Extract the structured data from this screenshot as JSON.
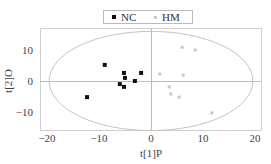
{
  "chart_data": {
    "type": "scatter",
    "title": "",
    "xlabel": "t[1]P",
    "ylabel": "t[2]O",
    "xlim": [
      -22,
      22.5
    ],
    "ylim": [
      -16,
      17
    ],
    "xticks": [
      -20,
      -10,
      0,
      10,
      20
    ],
    "yticks": [
      -10,
      0,
      10
    ],
    "grid": false,
    "legend_position": "top-center",
    "ellipse": {
      "cx": 0,
      "cy": 0,
      "rx": 19.6,
      "ry": 16
    },
    "series": [
      {
        "name": "NC",
        "color": "#111111",
        "marker": "square",
        "points": [
          [
            -8.9,
            5.2
          ],
          [
            -5.2,
            2.6
          ],
          [
            -1.9,
            2.6
          ],
          [
            -5.0,
            1.0
          ],
          [
            -3.1,
            0.0
          ],
          [
            -6.0,
            -1.0
          ],
          [
            -5.2,
            -1.9
          ],
          [
            -12.3,
            -5.2
          ]
        ]
      },
      {
        "name": "HM",
        "color": "#c8c8c8",
        "marker": "square-small",
        "points": [
          [
            6.0,
            10.9
          ],
          [
            8.5,
            10.0
          ],
          [
            1.7,
            2.3
          ],
          [
            6.2,
            1.9
          ],
          [
            3.5,
            -1.9
          ],
          [
            3.8,
            -4.2
          ],
          [
            5.4,
            -5.2
          ],
          [
            11.7,
            -10.3
          ]
        ]
      }
    ]
  },
  "legend": {
    "nc_label": "NC",
    "hm_label": "HM"
  }
}
